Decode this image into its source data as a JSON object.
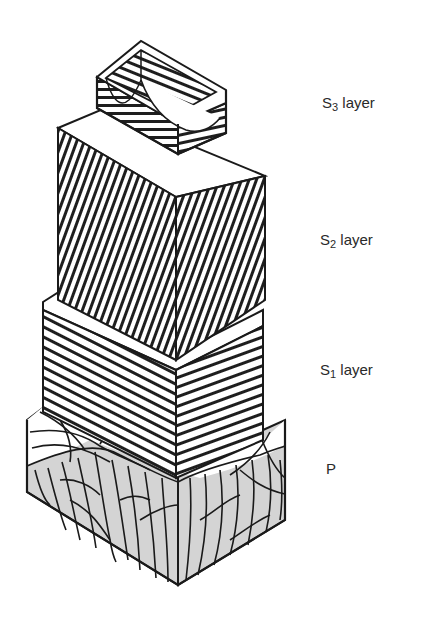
{
  "figure": {
    "type": "cell-wall-layer-diagram",
    "colors": {
      "line": "#1a1a1a",
      "hatch": "#1e1e1e",
      "face_light": "#ffffff",
      "primary_wall_fill": "#d4d4d4",
      "label": "#2a2a2a"
    }
  },
  "labels": {
    "s3": {
      "main": "S",
      "sub": "3",
      "rest": " layer"
    },
    "s2": {
      "main": "S",
      "sub": "2",
      "rest": " layer"
    },
    "s1": {
      "main": "S",
      "sub": "1",
      "rest": " layer"
    },
    "p": {
      "main": "P"
    }
  },
  "layers": [
    {
      "id": "S3",
      "hatch": "horizontal / shallow helical",
      "position": "innermost (top)"
    },
    {
      "id": "S2",
      "hatch": "steep near-vertical helical",
      "position": "middle"
    },
    {
      "id": "S1",
      "hatch": "flat helical (crossed)",
      "position": "outer secondary"
    },
    {
      "id": "P",
      "hatch": "random reticulated network",
      "position": "primary wall (bottom)"
    }
  ]
}
